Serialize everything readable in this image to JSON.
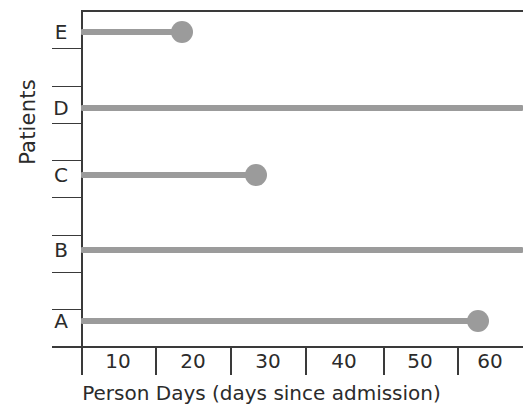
{
  "chart_data": {
    "type": "bar",
    "title": "",
    "xlabel": "Person Days (days since admission)",
    "ylabel": "Patients",
    "categories": [
      "A",
      "B",
      "C",
      "D",
      "E"
    ],
    "values": [
      53,
      59.5,
      23.5,
      59.5,
      13.5
    ],
    "xlim": [
      0,
      59.5
    ],
    "ylim": [
      0,
      6
    ],
    "grid": false,
    "legend": null,
    "xticks": [
      5,
      15,
      25,
      35,
      45,
      55
    ],
    "xticklabels": [
      "",
      "",
      "",
      "",
      "",
      ""
    ],
    "xlabels_between_ticks": [
      "10",
      "20",
      "30",
      "40",
      "50",
      "60"
    ],
    "series": [
      {
        "name": "Person days",
        "points": [
          {
            "patient": "E",
            "value": 13.5,
            "event": true,
            "marker": "circle"
          },
          {
            "patient": "D",
            "value": 59.5,
            "event": false,
            "marker": "none"
          },
          {
            "patient": "C",
            "value": 23.5,
            "event": true,
            "marker": "circle"
          },
          {
            "patient": "B",
            "value": 59.5,
            "event": false,
            "marker": "none"
          },
          {
            "patient": "A",
            "value": 53.0,
            "event": true,
            "marker": "circle"
          }
        ]
      }
    ],
    "colors": {
      "series": "#9b9b9b",
      "axis": "#3a3a3a",
      "text": "#2b2b2b",
      "background": "#ffffff"
    }
  },
  "axes": {
    "y_title": "Patients",
    "x_title": "Person Days (days since admission)",
    "y_categories": [
      {
        "label": "E",
        "y": 32
      },
      {
        "label": "D",
        "y": 108
      },
      {
        "label": "C",
        "y": 175
      },
      {
        "label": "B",
        "y": 250
      },
      {
        "label": "A",
        "y": 321
      }
    ],
    "y_tick_positions": [
      48,
      86,
      123,
      160,
      197,
      235,
      272,
      309,
      346
    ],
    "x_tick_positions": [
      81,
      155,
      230,
      305,
      383,
      457
    ],
    "x_tick_labels": [
      {
        "text": "10",
        "center": 118
      },
      {
        "text": "20",
        "center": 193
      },
      {
        "text": "30",
        "center": 268
      },
      {
        "text": "40",
        "center": 344
      },
      {
        "text": "50",
        "center": 420
      },
      {
        "text": "60",
        "center": 490
      }
    ]
  },
  "geometry": {
    "origin_x": 81,
    "px_per_day": 7.45,
    "bars": [
      {
        "patient": "E",
        "y": 29,
        "x_start": 81,
        "x_end": 182,
        "dot": true,
        "dot_x": 182,
        "dot_y": 21
      },
      {
        "patient": "D",
        "y": 105,
        "x_start": 81,
        "x_end": 523,
        "dot": false,
        "dot_x": 0,
        "dot_y": 0
      },
      {
        "patient": "C",
        "y": 172,
        "x_start": 81,
        "x_end": 256,
        "dot": true,
        "dot_x": 256,
        "dot_y": 164
      },
      {
        "patient": "B",
        "y": 247,
        "x_start": 81,
        "x_end": 523,
        "dot": false,
        "dot_x": 0,
        "dot_y": 0
      },
      {
        "patient": "A",
        "y": 318,
        "x_start": 81,
        "x_end": 478,
        "dot": true,
        "dot_x": 478,
        "dot_y": 310
      }
    ]
  }
}
